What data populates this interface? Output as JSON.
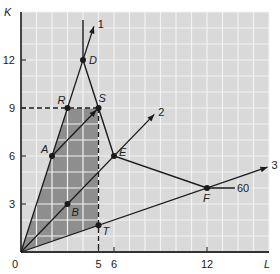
{
  "axes": {
    "x_label": "L",
    "y_label": "K",
    "origin_label": "0",
    "x_ticks": [
      {
        "value": 5,
        "label": "5"
      },
      {
        "value": 6,
        "label": "6"
      },
      {
        "value": 12,
        "label": "12"
      }
    ],
    "y_ticks": [
      {
        "value": 3,
        "label": "3"
      },
      {
        "value": 6,
        "label": "6"
      },
      {
        "value": 9,
        "label": "9"
      },
      {
        "value": 12,
        "label": "12"
      }
    ],
    "x_range": [
      0,
      16
    ],
    "y_range": [
      0,
      15
    ]
  },
  "rays": [
    {
      "label": "1",
      "slope": 3,
      "end": [
        4.7,
        14.1
      ]
    },
    {
      "label": "2",
      "slope": 1,
      "end": [
        8.6,
        8.6
      ]
    },
    {
      "label": "3",
      "slope": 0.3333,
      "end": [
        15.9,
        5.3
      ]
    }
  ],
  "points": [
    {
      "label": "D",
      "L": 4,
      "K": 12
    },
    {
      "label": "R",
      "L": 3,
      "K": 9
    },
    {
      "label": "S",
      "L": 5,
      "K": 9
    },
    {
      "label": "A",
      "L": 2,
      "K": 6
    },
    {
      "label": "E",
      "L": 6,
      "K": 6
    },
    {
      "label": "B",
      "L": 3,
      "K": 3
    },
    {
      "label": "F",
      "L": 12,
      "K": 4
    },
    {
      "label": "T",
      "L": 5,
      "K": 1.67
    }
  ],
  "isoquant": {
    "label": "60",
    "path": [
      [
        4,
        14.5
      ],
      [
        4,
        12
      ],
      [
        5,
        9
      ],
      [
        6,
        6
      ],
      [
        12,
        4
      ],
      [
        13.8,
        4
      ]
    ]
  },
  "shaded_region": [
    [
      0,
      0
    ],
    [
      3,
      9
    ],
    [
      5,
      9
    ],
    [
      5,
      1.67
    ]
  ],
  "dashed_lines": [
    {
      "from": [
        0,
        9
      ],
      "to": [
        5,
        9
      ]
    },
    {
      "from": [
        5,
        9
      ],
      "to": [
        5,
        0
      ]
    }
  ],
  "vector_AS": {
    "from": [
      2,
      6
    ],
    "to": [
      5,
      9
    ]
  },
  "colors": {
    "grid_bg": "#d9d9d9",
    "grid_line": "#f2f2f2",
    "shade": "#8e8e8e",
    "line": "#1a1a1a"
  }
}
